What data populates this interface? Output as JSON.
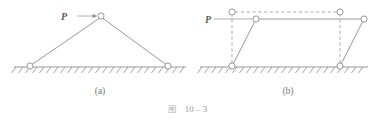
{
  "figure": {
    "caption_symbol": "图",
    "caption_number": "10 – 3",
    "subfigures": [
      {
        "key": "a",
        "label": "(a)"
      },
      {
        "key": "b",
        "label": "(b)"
      }
    ]
  },
  "diagram_a": {
    "name": "two-bar-triangular-truss",
    "load_label": "P",
    "ground_label": "",
    "geometry": {
      "apex": [
        101,
        16
      ],
      "left_support": [
        30,
        66
      ],
      "right_support": [
        168,
        66
      ],
      "ground_y": 67,
      "ground_x_start": 14,
      "ground_x_end": 186,
      "joint_radius": 3.1,
      "load_arrow_from": [
        77,
        16
      ],
      "load_arrow_to": [
        96,
        16
      ]
    }
  },
  "diagram_b": {
    "name": "four-bar-parallelogram-mechanism",
    "load_label": "P",
    "geometry": {
      "ground_y": 67,
      "ground_x_start": 200,
      "ground_x_end": 368,
      "left_pivot": [
        232,
        66
      ],
      "right_pivot": [
        340,
        66
      ],
      "original_top_left": [
        232,
        12
      ],
      "original_top_right": [
        340,
        12
      ],
      "displaced_top_left": [
        256,
        19
      ],
      "displaced_top_right": [
        364,
        19
      ],
      "joint_radius": 3.1,
      "load_arrow_from": [
        214,
        19
      ],
      "load_arrow_to": [
        228,
        19
      ]
    }
  },
  "style": {
    "line_color": "#8c8c8c",
    "dash_color": "#9c9c9c",
    "joint_stroke": "#8c8c8c",
    "joint_fill": "#ffffff",
    "hatch_color": "#8c8c8c",
    "background": "#ffffff"
  }
}
